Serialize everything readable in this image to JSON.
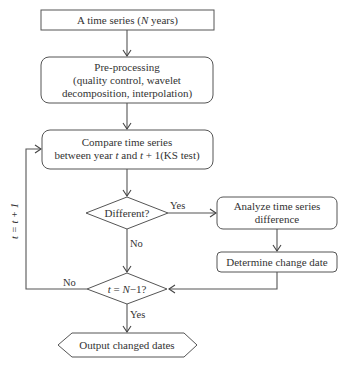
{
  "diagram": {
    "type": "flowchart",
    "nodes": {
      "start": {
        "shape": "rectangle",
        "lines": [
          "A time series (",
          "N",
          " years)"
        ]
      },
      "preprocess": {
        "shape": "rounded-rectangle",
        "lines": [
          "Pre-processing",
          "(quality control, wavelet",
          "decomposition, interpolation)"
        ]
      },
      "compare": {
        "shape": "rounded-rectangle",
        "line1": "Compare time series",
        "line2_parts": [
          "between year ",
          "t",
          " and ",
          "t",
          " + 1(KS test)"
        ]
      },
      "different": {
        "shape": "diamond",
        "label": "Different?"
      },
      "analyze": {
        "shape": "rounded-rectangle",
        "lines": [
          "Analyze time series",
          "difference"
        ]
      },
      "determine": {
        "shape": "rounded-rectangle",
        "label": "Determine change date"
      },
      "last_year": {
        "shape": "diamond",
        "parts": [
          "t",
          " = ",
          "N",
          "−1?"
        ]
      },
      "output": {
        "shape": "hexagon",
        "label": "Output changed dates"
      }
    },
    "edges": [
      {
        "from": "start",
        "to": "preprocess",
        "label": ""
      },
      {
        "from": "preprocess",
        "to": "compare",
        "label": ""
      },
      {
        "from": "compare",
        "to": "different",
        "label": ""
      },
      {
        "from": "different",
        "to": "analyze",
        "label": "Yes"
      },
      {
        "from": "different",
        "to": "last_year",
        "label": "No"
      },
      {
        "from": "analyze",
        "to": "determine",
        "label": ""
      },
      {
        "from": "determine",
        "to": "last_year",
        "label": ""
      },
      {
        "from": "last_year",
        "to": "compare",
        "label": "No",
        "loop_label": "t = t + 1"
      },
      {
        "from": "last_year",
        "to": "output",
        "label": "Yes"
      }
    ],
    "labels": {
      "yes_different": "Yes",
      "no_different": "No",
      "no_last": "No",
      "yes_last": "Yes",
      "loop": "t = t + 1"
    },
    "colors": {
      "stroke": "#555555",
      "text": "#333333",
      "background": "#ffffff"
    }
  }
}
